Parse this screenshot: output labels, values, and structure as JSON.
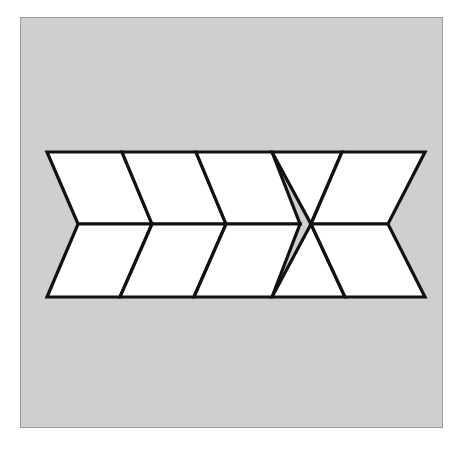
{
  "page": {
    "background_color": "#ffffff",
    "width": 459,
    "height": 458
  },
  "frame": {
    "name": "figure-frame",
    "fill_color": "#cfcfcf",
    "border_color": "#9a9a9a",
    "x": 20,
    "y": 17,
    "width": 423,
    "height": 411
  },
  "caption": {
    "text": ""
  },
  "figure": {
    "stroke_color": "#111111",
    "fill_color": "#ffffff",
    "stroke_width": 3.2,
    "band": {
      "top_y": 152,
      "middle_y": 224,
      "bottom_y": 297,
      "left_x": 47,
      "right_x": 425
    },
    "vertices": {
      "top": [
        47,
        122,
        196,
        272,
        342,
        425
      ],
      "middle": [
        78,
        152,
        226,
        300,
        311,
        388
      ],
      "bottom": [
        47,
        120,
        194,
        272,
        345,
        425
      ]
    },
    "cells": [
      {
        "name": "cell-top-1",
        "shape": "quadrilateral",
        "points": "47,152 122,152 152,224 78,224"
      },
      {
        "name": "cell-top-2",
        "shape": "quadrilateral",
        "points": "122,152 196,152 226,224 152,224"
      },
      {
        "name": "cell-top-3",
        "shape": "quadrilateral",
        "points": "196,152 272,152 300,224 226,224"
      },
      {
        "name": "cell-top-4",
        "shape": "triangle",
        "points": "272,152 342,152 311,224"
      },
      {
        "name": "cell-top-5",
        "shape": "quadrilateral",
        "points": "342,152 425,152 388,224 311,224"
      },
      {
        "name": "cell-bottom-1",
        "shape": "quadrilateral",
        "points": "78,224 152,224 120,297 47,297"
      },
      {
        "name": "cell-bottom-2",
        "shape": "quadrilateral",
        "points": "152,224 226,224 194,297 120,297"
      },
      {
        "name": "cell-bottom-3",
        "shape": "quadrilateral",
        "points": "226,224 300,224 272,297 194,297"
      },
      {
        "name": "cell-bottom-4",
        "shape": "triangle",
        "points": "311,224 345,297 272,297"
      },
      {
        "name": "cell-bottom-5",
        "shape": "quadrilateral",
        "points": "311,224 388,224 425,297 345,297"
      }
    ]
  }
}
